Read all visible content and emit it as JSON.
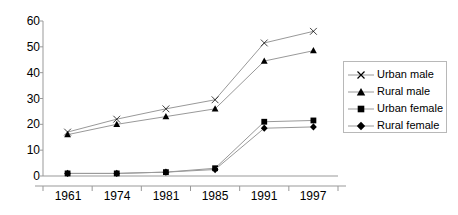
{
  "chart_data": {
    "type": "line",
    "title": "",
    "xlabel": "",
    "ylabel": "",
    "categories": [
      "1961",
      "1974",
      "1981",
      "1985",
      "1991",
      "1997"
    ],
    "ylim": [
      0,
      60
    ],
    "yticks": [
      0,
      10,
      20,
      30,
      40,
      50,
      60
    ],
    "grid": false,
    "legend_position": "right",
    "series": [
      {
        "name": "Urban male",
        "marker": "x",
        "values": [
          17,
          22,
          26,
          29.5,
          51.5,
          56
        ]
      },
      {
        "name": "Rural male",
        "marker": "triangle",
        "values": [
          16,
          20,
          23,
          26,
          44.5,
          48.5
        ]
      },
      {
        "name": "Urban female",
        "marker": "square",
        "values": [
          1,
          1,
          1.5,
          3,
          21,
          21.5
        ]
      },
      {
        "name": "Rural female",
        "marker": "diamond",
        "values": [
          1,
          1,
          1.5,
          2.5,
          18.5,
          19
        ]
      }
    ],
    "colors": {
      "line": "#999999",
      "marker": "#000000",
      "axis": "#999999",
      "text": "#000000",
      "background": "#ffffff",
      "legend_border": "#b8b8b8"
    }
  }
}
